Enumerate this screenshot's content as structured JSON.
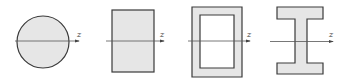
{
  "diagram": {
    "colors": {
      "fill": "#e6e6e6",
      "stroke": "#3a3a3a",
      "axis": "#555555",
      "background": "#ffffff"
    },
    "sections": [
      {
        "id": "circle",
        "shape": "solid-circle",
        "axis_label": "z"
      },
      {
        "id": "rectangle",
        "shape": "solid-rectangle",
        "axis_label": "z"
      },
      {
        "id": "hollow-box",
        "shape": "hollow-rectangle",
        "axis_label": "z"
      },
      {
        "id": "i-beam",
        "shape": "i-section",
        "axis_label": "z"
      }
    ]
  }
}
